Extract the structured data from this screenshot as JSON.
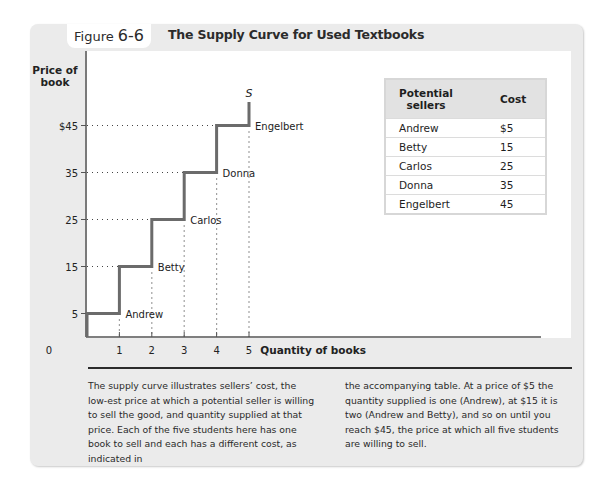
{
  "figure": {
    "label_word": "Figure",
    "label_number": "6-6",
    "title": "The Supply Curve for Used Textbooks"
  },
  "chart_data": {
    "type": "line",
    "subtype": "step",
    "title": "The Supply Curve for Used Textbooks",
    "xlabel": "Quantity of books",
    "ylabel": "Price of book",
    "x_ticks": [
      "0",
      "1",
      "2",
      "3",
      "4",
      "5"
    ],
    "y_ticks": [
      "5",
      "15",
      "25",
      "35",
      "$45"
    ],
    "xlim": [
      0,
      5
    ],
    "ylim": [
      0,
      50
    ],
    "grid": false,
    "series": [
      {
        "name": "S",
        "points": [
          {
            "price": 0,
            "quantity": 0
          },
          {
            "price": 5,
            "quantity": 0
          },
          {
            "price": 5,
            "quantity": 1
          },
          {
            "price": 15,
            "quantity": 1
          },
          {
            "price": 15,
            "quantity": 2
          },
          {
            "price": 25,
            "quantity": 2
          },
          {
            "price": 25,
            "quantity": 3
          },
          {
            "price": 35,
            "quantity": 3
          },
          {
            "price": 35,
            "quantity": 4
          },
          {
            "price": 45,
            "quantity": 4
          },
          {
            "price": 45,
            "quantity": 5
          },
          {
            "price": 50,
            "quantity": 5
          }
        ]
      }
    ],
    "annotations": [
      {
        "text": "Andrew",
        "quantity": 1,
        "price": 5
      },
      {
        "text": "Betty",
        "quantity": 2,
        "price": 15
      },
      {
        "text": "Carlos",
        "quantity": 3,
        "price": 25
      },
      {
        "text": "Donna",
        "quantity": 4,
        "price": 35
      },
      {
        "text": "Engelbert",
        "quantity": 5,
        "price": 45
      }
    ],
    "curve_label": "S"
  },
  "axes": {
    "y_title_line1": "Price of",
    "y_title_line2": "book",
    "x_title": "Quantity of books",
    "origin": "0"
  },
  "table": {
    "headers": {
      "sellers_line1": "Potential",
      "sellers_line2": "sellers",
      "cost": "Cost"
    },
    "rows": [
      {
        "name": "Andrew",
        "cost": "$5"
      },
      {
        "name": "Betty",
        "cost": "15"
      },
      {
        "name": "Carlos",
        "cost": "25"
      },
      {
        "name": "Donna",
        "cost": "35"
      },
      {
        "name": "Engelbert",
        "cost": "45"
      }
    ]
  },
  "caption": {
    "left": "The supply curve illustrates sellers’ cost, the low-est price at which a potential seller is willing to sell the good, and quantity supplied at that price. Each of the five students here has one book to sell and each has a different cost, as indicated in",
    "right": "the accompanying table. At a price of $5 the quantity supplied is one (Andrew), at $15 it is two (Andrew and Betty), and so on until you reach $45, the price at which all five students are willing to sell."
  },
  "colors": {
    "panel": "#ebebeb",
    "curve": "#6b6b6b",
    "axis": "#555555",
    "guide_dots": "#444444"
  }
}
